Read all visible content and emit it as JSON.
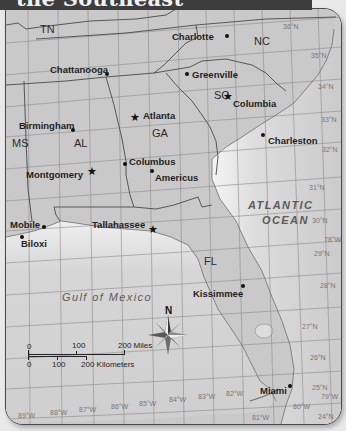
{
  "title": "the Southeast",
  "states": [
    {
      "abbr": "TN",
      "x": 34,
      "y": 14
    },
    {
      "abbr": "NC",
      "x": 248,
      "y": 26
    },
    {
      "abbr": "SC",
      "x": 208,
      "y": 80
    },
    {
      "abbr": "GA",
      "x": 146,
      "y": 118
    },
    {
      "abbr": "AL",
      "x": 68,
      "y": 128
    },
    {
      "abbr": "MS",
      "x": 6,
      "y": 128
    },
    {
      "abbr": "FL",
      "x": 198,
      "y": 246
    }
  ],
  "cities": [
    {
      "name": "Charlotte",
      "x": 186,
      "y": 24,
      "dot_x": 222,
      "dot_y": 28,
      "capital": false
    },
    {
      "name": "Chattanooga",
      "x": 44,
      "y": 56,
      "dot_x": 101,
      "dot_y": 66,
      "capital": false
    },
    {
      "name": "Greenville",
      "x": 186,
      "y": 65,
      "dot_x": 182,
      "dot_y": 66,
      "capital": false
    },
    {
      "name": "Columbia",
      "x": 226,
      "y": 89,
      "dot_x": 224,
      "dot_y": 87,
      "capital": true
    },
    {
      "name": "Atlanta",
      "x": 139,
      "y": 105,
      "dot_x": 130,
      "dot_y": 109,
      "capital": true
    },
    {
      "name": "Birmingham",
      "x": 14,
      "y": 111,
      "dot_x": 67,
      "dot_y": 121,
      "capital": false
    },
    {
      "name": "Charleston",
      "x": 262,
      "y": 126,
      "dot_x": 257,
      "dot_y": 124,
      "capital": false
    },
    {
      "name": "Columbus",
      "x": 121,
      "y": 149,
      "dot_x": 118,
      "dot_y": 154,
      "capital": false
    },
    {
      "name": "Americus",
      "x": 148,
      "y": 163,
      "dot_x": 145,
      "dot_y": 161,
      "capital": false
    },
    {
      "name": "Montgomery",
      "x": 20,
      "y": 162,
      "dot_x": 82,
      "dot_y": 160,
      "capital": true
    },
    {
      "name": "Mobile",
      "x": 4,
      "y": 211,
      "dot_x": 36,
      "dot_y": 217,
      "capital": false
    },
    {
      "name": "Biloxi",
      "x": 15,
      "y": 227,
      "dot_x": 14,
      "dot_y": 228,
      "capital": false
    },
    {
      "name": "Tallahassee",
      "x": 86,
      "y": 210,
      "dot_x": 144,
      "dot_y": 219,
      "capital": true
    },
    {
      "name": "Kissimmee",
      "x": 187,
      "y": 279,
      "dot_x": 237,
      "dot_y": 277,
      "capital": false
    },
    {
      "name": "Miami",
      "x": 255,
      "y": 377,
      "dot_x": 283,
      "dot_y": 377,
      "capital": false
    }
  ],
  "water_bodies": [
    {
      "name": "ATLANTIC",
      "x": 242,
      "y": 190
    },
    {
      "name": "OCEAN",
      "x": 256,
      "y": 206
    },
    {
      "name": "Gulf of Mexico",
      "x": 56,
      "y": 286
    }
  ],
  "latitude_labels": [
    {
      "text": "36°N",
      "x": 301,
      "y": 14
    },
    {
      "text": "35°N",
      "x": 305,
      "y": 42
    },
    {
      "text": "34°N",
      "x": 314,
      "y": 75
    },
    {
      "text": "33°N",
      "x": 317,
      "y": 107
    },
    {
      "text": "32°N",
      "x": 318,
      "y": 138
    },
    {
      "text": "31°N",
      "x": 302,
      "y": 175
    },
    {
      "text": "30°N",
      "x": 306,
      "y": 208
    },
    {
      "text": "29°N",
      "x": 308,
      "y": 240
    },
    {
      "text": "28°N",
      "x": 314,
      "y": 273
    },
    {
      "text": "27°N",
      "x": 296,
      "y": 313
    },
    {
      "text": "26°N",
      "x": 304,
      "y": 345
    },
    {
      "text": "25°N",
      "x": 306,
      "y": 375
    },
    {
      "text": "24°N",
      "x": 312,
      "y": 404
    }
  ],
  "longitude_labels": [
    {
      "text": "89°W",
      "x": 12,
      "y": 402
    },
    {
      "text": "88°W",
      "x": 44,
      "y": 399
    },
    {
      "text": "87°W",
      "x": 73,
      "y": 396
    },
    {
      "text": "86°W",
      "x": 105,
      "y": 393
    },
    {
      "text": "85°W",
      "x": 133,
      "y": 390
    },
    {
      "text": "84°W",
      "x": 163,
      "y": 386
    },
    {
      "text": "83°W",
      "x": 192,
      "y": 383
    },
    {
      "text": "82°W",
      "x": 220,
      "y": 381
    },
    {
      "text": "81°W",
      "x": 246,
      "y": 405
    },
    {
      "text": "80°W",
      "x": 286,
      "y": 393
    },
    {
      "text": "79°W",
      "x": 314,
      "y": 384
    },
    {
      "text": "78°W",
      "x": 318,
      "y": 226
    }
  ],
  "compass": {
    "label": "N"
  },
  "scale": {
    "miles_ticks": [
      "0",
      "100",
      "200 Miles"
    ],
    "km_ticks": [
      "0",
      "100",
      "200 Kilometers"
    ]
  }
}
